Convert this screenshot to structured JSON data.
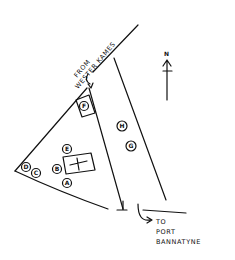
{
  "map": {
    "labels": {
      "from_line1": "FROM",
      "from_line2": "WESTER KAMES",
      "to_line1": "TO",
      "to_line2": "PORT",
      "to_line3": "BANNATYNE",
      "north": "N"
    },
    "markers": [
      {
        "id": "A",
        "label": "A"
      },
      {
        "id": "B",
        "label": "B"
      },
      {
        "id": "C",
        "label": "C"
      },
      {
        "id": "D",
        "label": "D"
      },
      {
        "id": "E",
        "label": "E"
      },
      {
        "id": "F",
        "label": "F"
      },
      {
        "id": "G",
        "label": "G"
      },
      {
        "id": "H",
        "label": "H"
      }
    ],
    "colors": {
      "ink": "#111111",
      "paper": "#ffffff"
    }
  }
}
